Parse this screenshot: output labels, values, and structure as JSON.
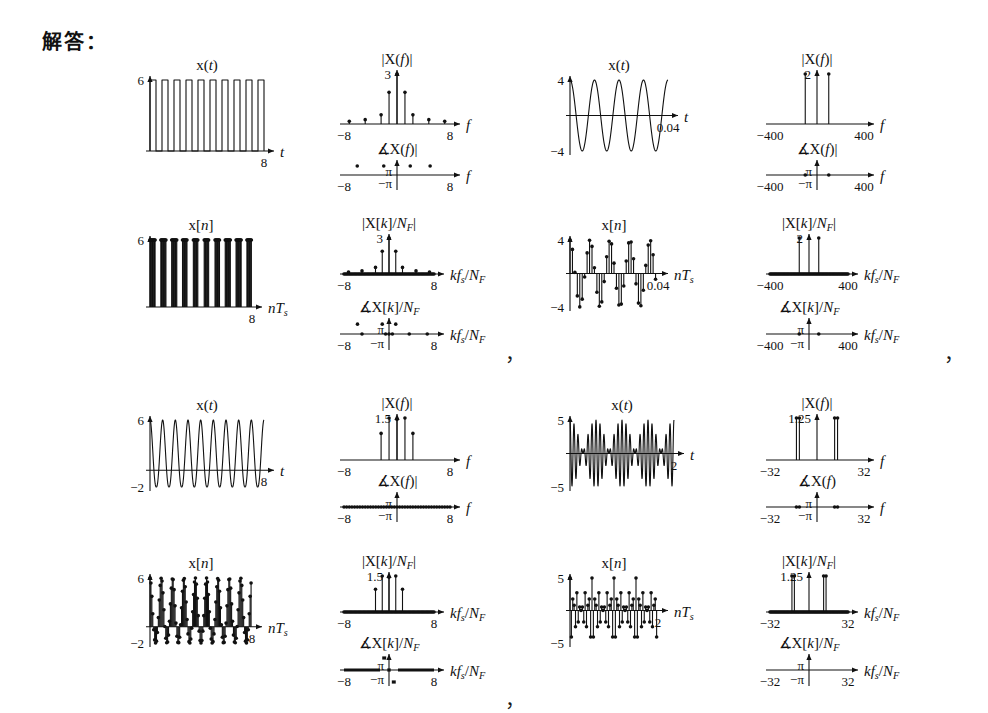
{
  "page": {
    "heading": "解答：",
    "background": "#ffffff",
    "ink": "#111111",
    "separator_commas": [
      "，",
      "，",
      "，"
    ]
  },
  "labels": {
    "xt": "x(t)",
    "xn": "x[n]",
    "magX_f": "|X(f)|",
    "angX_f": "∡X(f)|",
    "angX_f_plain": "∡X(f)",
    "magX_k": "|X[k]/N_F|",
    "angX_k": "∡X[k]/N_F",
    "axis_t": "t",
    "axis_f": "f",
    "axis_nTs": "nT_s",
    "axis_kfs": "kf_s/N_F",
    "pi": "π",
    "neg_pi": "−π"
  },
  "chart_data": [
    {
      "id": "q1-time-continuous",
      "type": "line",
      "title": "x(t)",
      "xlabel": "t",
      "ylabel": "",
      "xlim": [
        0,
        8
      ],
      "ylim": [
        0,
        6
      ],
      "xticks": [
        "8"
      ],
      "yticks": [
        "6"
      ],
      "waveform": "square",
      "periods": 9.5,
      "duty": 0.5,
      "amplitude": 6,
      "offset": 0,
      "grid": false
    },
    {
      "id": "q1-mag-continuous",
      "type": "stem",
      "title": "|X(f)|",
      "xlabel": "f",
      "ylabel": "",
      "xlim": [
        -8,
        8
      ],
      "ylim": [
        0,
        3
      ],
      "xticks": [
        "-8",
        "8"
      ],
      "yticks": [
        "3"
      ],
      "stems_x": [
        -7.2,
        -6.0,
        -4.8,
        -3.6,
        -2.4,
        -1.2,
        0,
        1.2,
        2.4,
        3.6,
        4.8,
        6.0,
        7.2
      ],
      "stems_y": [
        0.16,
        0.0,
        0.26,
        0.0,
        0.55,
        0.0,
        3.0,
        0.0,
        0.55,
        0.0,
        0.26,
        0.0,
        0.16
      ],
      "extra_stems_x": [
        -1.2,
        1.2
      ],
      "extra_stems_y": [
        1.9,
        1.9
      ],
      "grid": false
    },
    {
      "id": "q1-phase-continuous",
      "type": "stem",
      "title": "∡X(f)|",
      "xlabel": "f",
      "ylabel": "",
      "xlim": [
        -8,
        8
      ],
      "ylim": [
        -3.14159,
        3.14159
      ],
      "xticks": [
        "-8",
        "8"
      ],
      "yticks": [
        "π",
        "−π"
      ],
      "stems_x": [
        -7.2,
        -6.6,
        -6.0,
        -5.4,
        -4.8,
        -4.2,
        -3.6,
        -3.0,
        -2.4,
        -1.8,
        -1.2,
        -0.6,
        0,
        0.6,
        1.2,
        1.8,
        2.4,
        3.0,
        3.6,
        4.2,
        4.8,
        5.4,
        6.0,
        6.6,
        7.2
      ],
      "stems_y": [
        0,
        0,
        0,
        0,
        0,
        0,
        0,
        0,
        0,
        0,
        0,
        0,
        0,
        0,
        0,
        0,
        0,
        0,
        0,
        0,
        0,
        0,
        0,
        0,
        0
      ],
      "pi_dots_x": [
        -6.0,
        -2.0,
        2.0,
        5.0
      ],
      "grid": false
    },
    {
      "id": "q1-time-discrete",
      "type": "stem",
      "title": "x[n]",
      "xlabel": "nT_s",
      "ylabel": "",
      "xlim": [
        0,
        8
      ],
      "ylim": [
        0,
        6
      ],
      "xticks": [
        "8"
      ],
      "yticks": [
        "6"
      ],
      "waveform": "square-sampled",
      "periods": 9.5,
      "samples": 160,
      "amplitude": 6,
      "grid": false
    },
    {
      "id": "q1-mag-discrete",
      "type": "stem",
      "title": "|X[k]/N_F|",
      "xlabel": "kf_s/N_F",
      "ylabel": "",
      "xlim": [
        -8,
        8
      ],
      "ylim": [
        0,
        3
      ],
      "xticks": [
        "-8",
        "8"
      ],
      "yticks": [
        "3"
      ],
      "stems_x": [
        -7.2,
        -4.8,
        -2.4,
        0,
        2.4,
        4.8,
        7.2
      ],
      "stems_y": [
        0.16,
        0.26,
        0.55,
        3.0,
        0.55,
        0.26,
        0.16
      ],
      "extra_stems_x": [
        -1.2,
        1.2
      ],
      "extra_stems_y": [
        1.9,
        1.9
      ],
      "baseline_dense": true,
      "grid": false
    },
    {
      "id": "q1-phase-discrete",
      "type": "stem",
      "title": "∡X[k]/N_F",
      "xlabel": "kf_s/N_F",
      "ylabel": "",
      "xlim": [
        -8,
        8
      ],
      "ylim": [
        -3.14159,
        3.14159
      ],
      "xticks": [
        "-8",
        "8"
      ],
      "yticks": [
        "π",
        "−π"
      ],
      "pi_dots_x": [
        -5.6,
        -1.2,
        1.2
      ],
      "zero_dots_x": [
        -4.8,
        -0.6,
        0,
        0.6,
        3.6,
        6.8
      ],
      "grid": false
    },
    {
      "id": "q2-time-continuous",
      "type": "line",
      "title": "x(t)",
      "xlabel": "t",
      "ylabel": "",
      "xlim": [
        0,
        0.04
      ],
      "ylim": [
        -4,
        4
      ],
      "xticks": [
        "0.04"
      ],
      "yticks": [
        "4",
        "-4"
      ],
      "waveform": "sine",
      "periods": 4,
      "amplitude": 4,
      "grid": false
    },
    {
      "id": "q2-mag-continuous",
      "type": "stem",
      "title": "|X(f)|",
      "xlabel": "f",
      "ylabel": "",
      "xlim": [
        -400,
        400
      ],
      "ylim": [
        0,
        2
      ],
      "xticks": [
        "-400",
        "400"
      ],
      "yticks": [
        "2"
      ],
      "stems_x": [
        -100,
        100
      ],
      "stems_y": [
        2,
        2
      ],
      "grid": false
    },
    {
      "id": "q2-phase-continuous",
      "type": "stem",
      "title": "∡X(f)|",
      "xlabel": "f",
      "ylabel": "",
      "xlim": [
        -400,
        400
      ],
      "ylim": [
        -3.14159,
        3.14159
      ],
      "xticks": [
        "-400",
        "400"
      ],
      "yticks": [
        "π",
        "−π"
      ],
      "zero_dots_x": [
        -100,
        100
      ],
      "grid": false
    },
    {
      "id": "q2-time-discrete",
      "type": "stem",
      "title": "x[n]",
      "xlabel": "nT_s",
      "ylabel": "",
      "xlim": [
        0,
        0.04
      ],
      "ylim": [
        -4,
        4
      ],
      "xticks": [
        "0.04"
      ],
      "yticks": [
        "4",
        "-4"
      ],
      "waveform": "sine-sampled",
      "periods": 4,
      "samples": 36,
      "amplitude": 4,
      "grid": false
    },
    {
      "id": "q2-mag-discrete",
      "type": "stem",
      "title": "|X[k]/N_F|",
      "xlabel": "kf_s/N_F",
      "ylabel": "",
      "xlim": [
        -400,
        400
      ],
      "ylim": [
        0,
        2
      ],
      "xticks": [
        "-400",
        "400"
      ],
      "yticks": [
        "2"
      ],
      "stems_x": [
        -100,
        100
      ],
      "stems_y": [
        2,
        2
      ],
      "baseline_dense": true,
      "grid": false
    },
    {
      "id": "q2-phase-discrete",
      "type": "stem",
      "title": "∡X[k]/N_F",
      "xlabel": "kf_s/N_F",
      "ylabel": "",
      "xlim": [
        -400,
        400
      ],
      "ylim": [
        -3.14159,
        3.14159
      ],
      "xticks": [
        "-400",
        "400"
      ],
      "yticks": [
        "π",
        "−π"
      ],
      "zero_dots_x": [
        -100,
        100
      ],
      "grid": false
    },
    {
      "id": "q3-time-continuous",
      "type": "line",
      "title": "x(t)",
      "xlabel": "t",
      "ylabel": "",
      "xlim": [
        0,
        8
      ],
      "ylim": [
        -2,
        6
      ],
      "xticks": [
        "8"
      ],
      "yticks": [
        "6",
        "-2"
      ],
      "waveform": "rectified",
      "periods": 9,
      "amplitude": 6,
      "grid": false
    },
    {
      "id": "q3-mag-continuous",
      "type": "stem",
      "title": "|X(f)|",
      "xlabel": "f",
      "ylabel": "",
      "xlim": [
        -8,
        8
      ],
      "ylim": [
        0,
        1.5
      ],
      "xticks": [
        "-8",
        "8"
      ],
      "yticks": [
        "1.5"
      ],
      "stems_x": [
        -2.4,
        -1.2,
        0,
        1.2,
        2.4
      ],
      "stems_y": [
        0.95,
        1.5,
        1.45,
        1.5,
        0.95
      ],
      "grid": false
    },
    {
      "id": "q3-phase-continuous",
      "type": "stem",
      "title": "∡X(f)|",
      "xlabel": "f",
      "ylabel": "",
      "xlim": [
        -8,
        8
      ],
      "ylim": [
        -3.14159,
        3.14159
      ],
      "xticks": [
        "-8",
        "8"
      ],
      "yticks": [
        "π",
        "−π"
      ],
      "zero_dense": true,
      "grid": false
    },
    {
      "id": "q3-time-discrete",
      "type": "stem",
      "title": "x[n]",
      "xlabel": "nT_s",
      "ylabel": "",
      "xlim": [
        0,
        8
      ],
      "ylim": [
        -2,
        6
      ],
      "xticks": [
        "8"
      ],
      "yticks": [
        "6",
        "-2"
      ],
      "waveform": "rectified-sampled",
      "periods": 9,
      "samples": 110,
      "amplitude": 6,
      "grid": false
    },
    {
      "id": "q3-mag-discrete",
      "type": "stem",
      "title": "|X[k]/N_F|",
      "xlabel": "kf_s/N_F",
      "ylabel": "",
      "xlim": [
        -8,
        8
      ],
      "ylim": [
        0,
        1.5
      ],
      "xticks": [
        "-8",
        "8"
      ],
      "yticks": [
        "1.5"
      ],
      "stems_x": [
        -2.4,
        -1.2,
        0,
        1.2,
        2.4
      ],
      "stems_y": [
        0.95,
        1.5,
        1.45,
        1.5,
        0.95
      ],
      "baseline_dense": true,
      "grid": false
    },
    {
      "id": "q3-phase-discrete",
      "type": "step",
      "title": "∡X[k]/N_F",
      "xlabel": "kf_s/N_F",
      "ylabel": "",
      "xlim": [
        -8,
        8
      ],
      "ylim": [
        -3.14159,
        3.14159
      ],
      "xticks": [
        "-8",
        "8"
      ],
      "yticks": [
        "π",
        "−π"
      ],
      "segments": [
        {
          "x0": -8,
          "x1": -1.6,
          "y": 0
        },
        {
          "x0": -1.2,
          "x1": -0.5,
          "y": 3.14159
        },
        {
          "x0": -0.3,
          "x1": 0.3,
          "y": 0
        },
        {
          "x0": 0.5,
          "x1": 1.2,
          "y": -3.14159
        },
        {
          "x0": 1.6,
          "x1": 8,
          "y": 0
        }
      ],
      "grid": false
    },
    {
      "id": "q4-time-continuous",
      "type": "line",
      "title": "x(t)",
      "xlabel": "t",
      "ylabel": "",
      "xlim": [
        0,
        2
      ],
      "ylim": [
        -5,
        5
      ],
      "xticks": [
        "2"
      ],
      "yticks": [
        "5",
        "-5"
      ],
      "waveform": "two-tone",
      "f1": 12,
      "f2": 14,
      "amplitude": 5,
      "grid": false
    },
    {
      "id": "q4-mag-continuous",
      "type": "stem",
      "title": "|X(f)|",
      "xlabel": "f",
      "ylabel": "",
      "xlim": [
        -32,
        32
      ],
      "ylim": [
        0,
        1.25
      ],
      "xticks": [
        "-32",
        "32"
      ],
      "yticks": [
        "1.25"
      ],
      "stems_x": [
        -14,
        -12,
        12,
        14
      ],
      "stems_y": [
        1.25,
        1.25,
        1.25,
        1.25
      ],
      "grid": false
    },
    {
      "id": "q4-phase-continuous",
      "type": "stem",
      "title": "∡X(f)",
      "xlabel": "f",
      "ylabel": "",
      "xlim": [
        -32,
        32
      ],
      "ylim": [
        -3.14159,
        3.14159
      ],
      "xticks": [
        "-32",
        "32"
      ],
      "yticks": [
        "π",
        "−π"
      ],
      "zero_dots_x": [
        -14,
        -12,
        12,
        14
      ],
      "grid": false
    },
    {
      "id": "q4-time-discrete",
      "type": "stem",
      "title": "x[n]",
      "xlabel": "nT_s",
      "ylabel": "",
      "xlim": [
        0,
        2
      ],
      "ylim": [
        -5,
        5
      ],
      "xticks": [
        "2"
      ],
      "yticks": [
        "5",
        "-5"
      ],
      "waveform": "two-tone-sampled",
      "f1": 12,
      "f2": 14,
      "samples": 64,
      "amplitude": 5,
      "grid": false
    },
    {
      "id": "q4-mag-discrete",
      "type": "stem",
      "title": "|X[k]/N_F|",
      "xlabel": "kf_s/N_F",
      "ylabel": "",
      "xlim": [
        -32,
        32
      ],
      "ylim": [
        0,
        1.25
      ],
      "xticks": [
        "-32",
        "32"
      ],
      "yticks": [
        "1.25"
      ],
      "stems_x": [
        -14,
        -12,
        12,
        14
      ],
      "stems_y": [
        1.25,
        1.25,
        1.25,
        1.25
      ],
      "baseline_dense": true,
      "grid": false
    },
    {
      "id": "q4-phase-discrete",
      "type": "stem",
      "title": "∡X[k]/N_F",
      "xlabel": "kf_s/N_F",
      "ylabel": "",
      "xlim": [
        -32,
        32
      ],
      "ylim": [
        -3.14159,
        3.14159
      ],
      "xticks": [
        "-32",
        "32"
      ],
      "yticks": [
        "π",
        "−π"
      ],
      "zero_dots_x": [],
      "grid": false
    }
  ]
}
